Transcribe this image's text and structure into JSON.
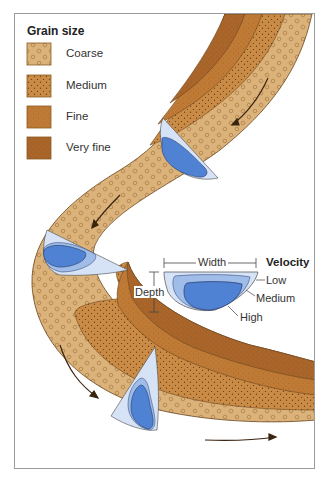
{
  "legend": {
    "title": "Grain size",
    "items": [
      {
        "label": "Coarse",
        "color": "#dbb27a",
        "pattern": "circles"
      },
      {
        "label": "Medium",
        "color": "#c98b45",
        "pattern": "dots"
      },
      {
        "label": "Fine",
        "color": "#bf7a35",
        "pattern": "fine-dots"
      },
      {
        "label": "Very fine",
        "color": "#a9652a",
        "pattern": "fine-dots"
      }
    ]
  },
  "cross_section": {
    "width_label": "Width",
    "depth_label": "Depth",
    "velocity_title": "Velocity",
    "velocity_levels": [
      {
        "label": "Low",
        "color": "#d6e3f6"
      },
      {
        "label": "Medium",
        "color": "#9fbde8"
      },
      {
        "label": "High",
        "color": "#4f82d2"
      }
    ]
  },
  "colors": {
    "coarse": "#dbb27a",
    "medium": "#c98b45",
    "fine": "#bf7a35",
    "very_fine": "#a9652a",
    "outline": "#6b4620",
    "arrow": "#3a2410",
    "frame": "#9a9a9a"
  }
}
